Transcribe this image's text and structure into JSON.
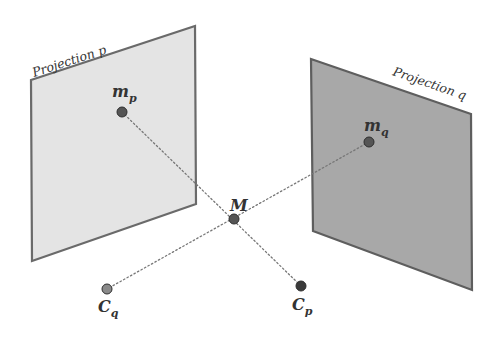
{
  "diagram": {
    "planes": [
      {
        "id": "p",
        "label": "Projection p",
        "fill": "#e4e4e4",
        "stroke": "#6a6a6a",
        "points": "31,80 195,26 196,204 32,261",
        "label_x": 34,
        "label_y": 77,
        "label_rotate": -18
      },
      {
        "id": "q",
        "label": "Projection q",
        "fill": "#a8a8a8",
        "stroke": "#5e5e5e",
        "points": "311,59 471,114 472,290 313,231",
        "label_x": 392,
        "label_y": 75,
        "label_rotate": 19
      }
    ],
    "points": [
      {
        "id": "m_p",
        "main": "m",
        "sub": "p",
        "x": 122,
        "y": 112,
        "fill": "#555555",
        "label_x": 112,
        "label_y": 97
      },
      {
        "id": "m_q",
        "main": "m",
        "sub": "q",
        "x": 369,
        "y": 142,
        "fill": "#555555",
        "label_x": 364,
        "label_y": 131
      },
      {
        "id": "M",
        "main": "M",
        "sub": "",
        "x": 234,
        "y": 219,
        "fill": "#555555",
        "label_x": 230,
        "label_y": 211
      },
      {
        "id": "C_q",
        "main": "C",
        "sub": "q",
        "x": 107,
        "y": 289,
        "fill": "#8a8a8a",
        "label_x": 98,
        "label_y": 312
      },
      {
        "id": "C_p",
        "main": "C",
        "sub": "p",
        "x": 301,
        "y": 286,
        "fill": "#3a3a3a",
        "label_x": 292,
        "label_y": 310
      }
    ],
    "rays": [
      {
        "from": "m_p",
        "to": "C_p",
        "x1": 122,
        "y1": 112,
        "x2": 301,
        "y2": 286
      },
      {
        "from": "m_q",
        "to": "C_q",
        "x1": 369,
        "y1": 142,
        "x2": 107,
        "y2": 289
      }
    ],
    "ray_color": "#777777"
  }
}
